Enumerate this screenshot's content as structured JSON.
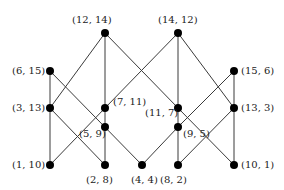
{
  "diagram": {
    "type": "hasse-diagram",
    "line_color": "#3a3a3a",
    "node_color": "#000000",
    "nodes": [
      {
        "id": "n12_14",
        "label": "(12, 14)",
        "x": 105,
        "y": 33,
        "lx": 72,
        "ly": 14
      },
      {
        "id": "n14_12",
        "label": "(14, 12)",
        "x": 178,
        "y": 33,
        "lx": 158,
        "ly": 14
      },
      {
        "id": "n6_15",
        "label": "(6, 15)",
        "x": 50,
        "y": 71,
        "lx": 12,
        "ly": 65
      },
      {
        "id": "n15_6",
        "label": "(15, 6)",
        "x": 234,
        "y": 71,
        "lx": 241,
        "ly": 65
      },
      {
        "id": "n3_13",
        "label": "(3, 13)",
        "x": 50,
        "y": 108,
        "lx": 12,
        "ly": 102
      },
      {
        "id": "n7_11",
        "label": "(7, 11)",
        "x": 105,
        "y": 108,
        "lx": 113,
        "ly": 96
      },
      {
        "id": "n11_7",
        "label": "(11, 7)",
        "x": 178,
        "y": 108,
        "lx": 145,
        "ly": 107
      },
      {
        "id": "n13_3",
        "label": "(13, 3)",
        "x": 234,
        "y": 108,
        "lx": 241,
        "ly": 102
      },
      {
        "id": "n5_9",
        "label": "(5, 9)",
        "x": 105,
        "y": 127,
        "lx": 79,
        "ly": 128
      },
      {
        "id": "n9_5",
        "label": "(9, 5)",
        "x": 178,
        "y": 127,
        "lx": 183,
        "ly": 128
      },
      {
        "id": "n1_10",
        "label": "(1, 10)",
        "x": 50,
        "y": 165,
        "lx": 12,
        "ly": 159
      },
      {
        "id": "n2_8",
        "label": "(2, 8)",
        "x": 105,
        "y": 165,
        "lx": 86,
        "ly": 174
      },
      {
        "id": "n4_4",
        "label": "(4, 4)",
        "x": 142,
        "y": 165,
        "lx": 131,
        "ly": 174
      },
      {
        "id": "n8_2",
        "label": "(8, 2)",
        "x": 178,
        "y": 165,
        "lx": 160,
        "ly": 174
      },
      {
        "id": "n10_1",
        "label": "(10, 1)",
        "x": 234,
        "y": 165,
        "lx": 241,
        "ly": 159
      }
    ],
    "edges": [
      [
        "n12_14",
        "n3_13"
      ],
      [
        "n12_14",
        "n7_11"
      ],
      [
        "n12_14",
        "n11_7"
      ],
      [
        "n14_12",
        "n7_11"
      ],
      [
        "n14_12",
        "n11_7"
      ],
      [
        "n14_12",
        "n13_3"
      ],
      [
        "n6_15",
        "n3_13"
      ],
      [
        "n6_15",
        "n4_4"
      ],
      [
        "n15_6",
        "n13_3"
      ],
      [
        "n15_6",
        "n9_5"
      ],
      [
        "n3_13",
        "n1_10"
      ],
      [
        "n3_13",
        "n2_8"
      ],
      [
        "n7_11",
        "n1_10"
      ],
      [
        "n7_11",
        "n5_9"
      ],
      [
        "n11_7",
        "n9_5"
      ],
      [
        "n11_7",
        "n10_1"
      ],
      [
        "n13_3",
        "n8_2"
      ],
      [
        "n13_3",
        "n10_1"
      ],
      [
        "n5_9",
        "n2_8"
      ],
      [
        "n9_5",
        "n4_4"
      ],
      [
        "n9_5",
        "n8_2"
      ]
    ]
  }
}
